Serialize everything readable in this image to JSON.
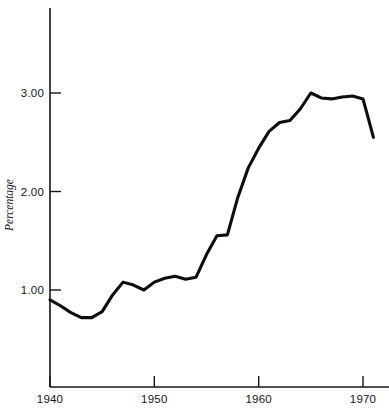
{
  "chart_data": {
    "type": "line",
    "title": "",
    "subtitle": "",
    "xlabel": "",
    "ylabel": "Percentage",
    "xlim": [
      1940,
      1971.5
    ],
    "ylim": [
      0.0,
      3.95
    ],
    "grid": false,
    "legend": null,
    "x_ticks": [
      "1940",
      "1950",
      "1960",
      "1970"
    ],
    "x_tick_values": [
      1940,
      1950,
      1960,
      1970
    ],
    "y_ticks": [
      "1.00",
      "2.00",
      "3.00"
    ],
    "y_tick_values": [
      1.0,
      2.0,
      3.0
    ],
    "series": [
      {
        "name": "Percentage",
        "color": "#0d0d0d",
        "x": [
          1940,
          1941,
          1942,
          1943,
          1944,
          1945,
          1946,
          1947,
          1948,
          1949,
          1950,
          1951,
          1952,
          1953,
          1954,
          1955,
          1956,
          1957,
          1958,
          1959,
          1960,
          1961,
          1962,
          1963,
          1964,
          1965,
          1966,
          1967,
          1968,
          1969,
          1970,
          1971
        ],
        "values": [
          0.9,
          0.84,
          0.77,
          0.72,
          0.72,
          0.78,
          0.95,
          1.08,
          1.05,
          1.0,
          1.08,
          1.12,
          1.14,
          1.11,
          1.13,
          1.36,
          1.55,
          1.56,
          1.94,
          2.24,
          2.44,
          2.61,
          2.7,
          2.72,
          2.84,
          3.0,
          2.95,
          2.94,
          2.96,
          2.97,
          2.94,
          2.55
        ]
      }
    ],
    "annotations": []
  },
  "axis": {
    "y_title": "Percentage",
    "y_tick_labels": [
      "3.00",
      "2.00",
      "1.00"
    ],
    "x_tick_labels": [
      "1940",
      "1950",
      "1960",
      "1970"
    ]
  },
  "colors": {
    "line": "#0d0d0d",
    "axis": "#151515",
    "background": "#ffffff",
    "text": "#141414"
  }
}
